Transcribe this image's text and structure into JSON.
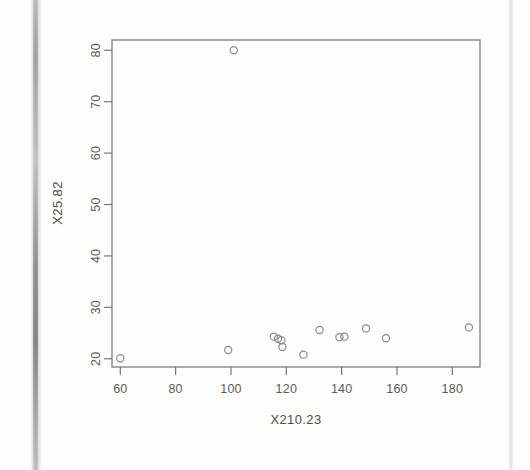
{
  "figure": {
    "kind": "scatter-plot",
    "background_color": "#fdfdfc",
    "ink_color": "#6f6d6b",
    "point_color": "#8a8885",
    "artifacts": {
      "left_page_edge": "vertical-scan-stripe",
      "right_page_edge": "vertical-scan-stripe"
    }
  },
  "chart_data": {
    "type": "scatter",
    "title": "",
    "xlabel": "X210.23",
    "ylabel": "X25.82",
    "xlim": [
      57,
      190
    ],
    "ylim": [
      18.4,
      82
    ],
    "grid": false,
    "legend": null,
    "marker": "open-circle",
    "xticks": [
      60,
      80,
      100,
      120,
      140,
      160,
      180
    ],
    "xtick_labels": [
      "60",
      "80",
      "100",
      "120",
      "140",
      "160",
      "180"
    ],
    "yticks": [
      20,
      30,
      40,
      50,
      60,
      70,
      80
    ],
    "ytick_labels": [
      "20",
      "30",
      "40",
      "50",
      "60",
      "70",
      "80"
    ],
    "x": [
      60.0,
      99.0,
      101.0,
      115.5,
      117.0,
      118.2,
      118.6,
      126.2,
      132.0,
      139.2,
      141.0,
      148.8,
      156.0,
      186.0
    ],
    "y": [
      20.1,
      21.7,
      80.0,
      24.3,
      23.9,
      23.6,
      22.3,
      20.8,
      25.6,
      24.2,
      24.3,
      25.9,
      24.0,
      26.1
    ],
    "points": [
      {
        "x": 60.0,
        "y": 20.1
      },
      {
        "x": 99.0,
        "y": 21.7
      },
      {
        "x": 101.0,
        "y": 80.0
      },
      {
        "x": 115.5,
        "y": 24.3
      },
      {
        "x": 117.0,
        "y": 23.9
      },
      {
        "x": 118.2,
        "y": 23.6
      },
      {
        "x": 118.6,
        "y": 22.3
      },
      {
        "x": 126.2,
        "y": 20.8
      },
      {
        "x": 132.0,
        "y": 25.6
      },
      {
        "x": 139.2,
        "y": 24.2
      },
      {
        "x": 141.0,
        "y": 24.3
      },
      {
        "x": 148.8,
        "y": 25.9
      },
      {
        "x": 156.0,
        "y": 24.0
      },
      {
        "x": 186.0,
        "y": 26.1
      }
    ],
    "n_points": 14
  }
}
